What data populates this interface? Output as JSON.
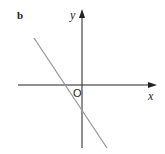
{
  "figure": {
    "panel_label": "b",
    "x_axis_label": "x",
    "y_axis_label": "y",
    "origin_label": "O"
  },
  "colors": {
    "axis": "#222222",
    "line": "#999999",
    "background": "#ffffff"
  },
  "geometry": {
    "origin_px": [
      82,
      85
    ],
    "x_axis": {
      "from_px": [
        18,
        85
      ],
      "to_px": [
        156,
        85
      ]
    },
    "y_axis": {
      "from_px": [
        82,
        148
      ],
      "to_px": [
        82,
        10
      ]
    },
    "line": {
      "from_px": [
        34,
        38
      ],
      "to_px": [
        107,
        148
      ],
      "slope_sign": "negative",
      "x_intercept_sign": "negative",
      "y_intercept_sign": "negative"
    }
  }
}
